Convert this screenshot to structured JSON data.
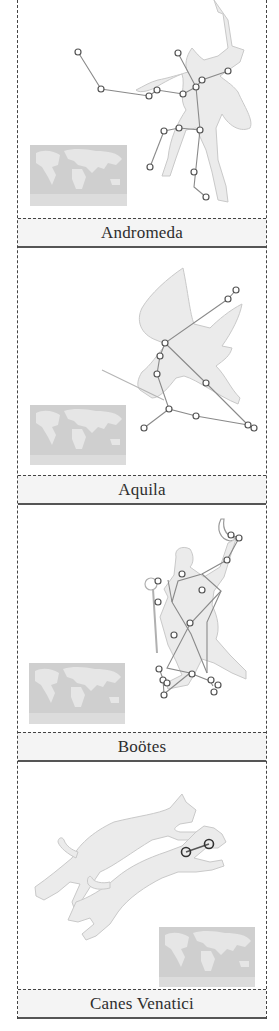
{
  "cards": [
    {
      "name": "Andromeda",
      "label": "Andromeda",
      "figure": "woman-icon",
      "star_count": 15
    },
    {
      "name": "Aquila",
      "label": "Aquila",
      "figure": "eagle-icon",
      "star_count": 11
    },
    {
      "name": "Bootes",
      "label": "Boötes",
      "figure": "herdsman-icon",
      "star_count": 17
    },
    {
      "name": "Canes Venatici",
      "label": "Canes Venatici",
      "figure": "hunting-dogs-icon",
      "star_count": 2
    }
  ],
  "colors": {
    "border": "#444444",
    "label_bg": "#f4f4f4",
    "label_text": "#2e2e2e",
    "figure_fill": "#ebebeb",
    "map_fill": "#cfcfcf",
    "star_stroke": "#555555"
  }
}
